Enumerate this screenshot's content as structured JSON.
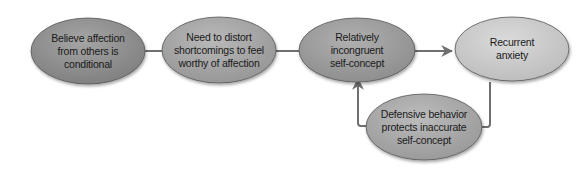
{
  "diagram": {
    "type": "flowchart",
    "nodes": [
      {
        "id": "n1",
        "label": "Believe affection from others is conditional",
        "lines": [
          "Believe affection",
          "from others is",
          "conditional"
        ],
        "cx": 88,
        "cy": 51,
        "rx": 57,
        "ry": 33,
        "fill": "#8c8c8c"
      },
      {
        "id": "n2",
        "label": "Need to distort shortcomings to feel worthy of affection",
        "lines": [
          "Need to distort",
          "shortcomings to feel",
          "worthy of affection"
        ],
        "cx": 219,
        "cy": 50,
        "rx": 57,
        "ry": 33,
        "fill": "#a2a2a2"
      },
      {
        "id": "n3",
        "label": "Relatively incongruent self-concept",
        "lines": [
          "Relatively",
          "incongruent",
          "self-concept"
        ],
        "cx": 357,
        "cy": 50,
        "rx": 58,
        "ry": 32,
        "fill": "#999999"
      },
      {
        "id": "n4",
        "label": "Recurrent anxiety",
        "lines": [
          "Recurrent",
          "anxiety"
        ],
        "cx": 512,
        "cy": 49,
        "rx": 57,
        "ry": 32,
        "fill": "#c9c9c9"
      },
      {
        "id": "n5",
        "label": "Defensive behavior protects inaccurate self-concept",
        "lines": [
          "Defensive behavior",
          "protects inaccurate",
          "self-concept"
        ],
        "cx": 424,
        "cy": 127,
        "rx": 58,
        "ry": 33,
        "fill": "#a6a6a6"
      }
    ],
    "edges": [
      {
        "from": "n1",
        "to": "n2"
      },
      {
        "from": "n2",
        "to": "n3"
      },
      {
        "from": "n3",
        "to": "n4"
      },
      {
        "from": "n4",
        "to": "n5"
      },
      {
        "from": "n5",
        "to": "n3"
      }
    ],
    "colors": {
      "arrow": "#6f6f6f",
      "outline": "#555555",
      "text": "#1a1a1a"
    }
  }
}
